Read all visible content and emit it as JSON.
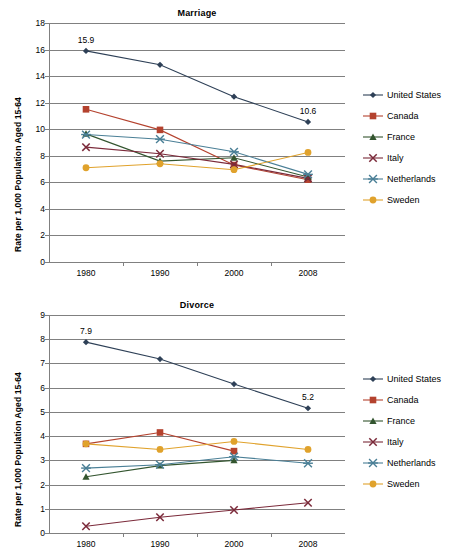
{
  "figure": {
    "width": 466,
    "height": 555
  },
  "series_styles": [
    {
      "name": "United States",
      "color": "#2e4057",
      "marker": "diamond"
    },
    {
      "name": "Canada",
      "color": "#b4422e",
      "marker": "square"
    },
    {
      "name": "France",
      "color": "#33552f",
      "marker": "triangle"
    },
    {
      "name": "Italy",
      "color": "#7b2a3a",
      "marker": "x"
    },
    {
      "name": "Netherlands",
      "color": "#4a7f96",
      "marker": "asterisk"
    },
    {
      "name": "Sweden",
      "color": "#e0a22c",
      "marker": "circle"
    }
  ],
  "legend": {
    "position": "right",
    "items": [
      {
        "label": "United States"
      },
      {
        "label": "Canada"
      },
      {
        "label": "France"
      },
      {
        "label": "Italy"
      },
      {
        "label": "Netherlands"
      },
      {
        "label": "Sweden"
      }
    ]
  },
  "chart_data": [
    {
      "id": "marriage",
      "type": "line",
      "title": "Marriage",
      "xlabel": "",
      "ylabel": "Rate per 1,000 Population Aged 15-64",
      "categories": [
        "1980",
        "1990",
        "2000",
        "2008"
      ],
      "ylim": [
        0,
        18
      ],
      "ytick_step": 2,
      "yticks": [
        0,
        2,
        4,
        6,
        8,
        10,
        12,
        14,
        16,
        18
      ],
      "grid": true,
      "series": [
        {
          "name": "United States",
          "values": [
            15.9,
            14.85,
            12.45,
            10.55
          ]
        },
        {
          "name": "Canada",
          "values": [
            11.5,
            9.95,
            7.3,
            6.2
          ]
        },
        {
          "name": "France",
          "values": [
            9.65,
            7.6,
            7.85,
            6.4
          ]
        },
        {
          "name": "Italy",
          "values": [
            8.65,
            8.15,
            7.35,
            6.3
          ]
        },
        {
          "name": "Netherlands",
          "values": [
            9.6,
            9.25,
            8.3,
            6.6
          ]
        },
        {
          "name": "Sweden",
          "values": [
            7.1,
            7.4,
            6.95,
            8.25
          ]
        }
      ],
      "annotations": [
        {
          "text": "15.9",
          "series": "United States",
          "category": "1980"
        },
        {
          "text": "10.6",
          "series": "United States",
          "category": "2008"
        }
      ]
    },
    {
      "id": "divorce",
      "type": "line",
      "title": "Divorce",
      "xlabel": "",
      "ylabel": "Rate per 1,000 Population Aged 15-64",
      "categories": [
        "1980",
        "1990",
        "2000",
        "2008"
      ],
      "ylim": [
        0,
        9
      ],
      "ytick_step": 1,
      "yticks": [
        0,
        1,
        2,
        3,
        4,
        5,
        6,
        7,
        8,
        9
      ],
      "grid": true,
      "series": [
        {
          "name": "United States",
          "values": [
            7.88,
            7.18,
            6.15,
            5.15
          ]
        },
        {
          "name": "Canada",
          "values": [
            3.68,
            4.15,
            3.38,
            null
          ]
        },
        {
          "name": "France",
          "values": [
            2.32,
            2.78,
            3.0,
            null
          ]
        },
        {
          "name": "Italy",
          "values": [
            0.28,
            0.65,
            0.95,
            1.25
          ]
        },
        {
          "name": "Netherlands",
          "values": [
            2.68,
            2.82,
            3.15,
            2.88
          ]
        },
        {
          "name": "Sweden",
          "values": [
            3.68,
            3.45,
            3.78,
            3.45
          ]
        }
      ],
      "annotations": [
        {
          "text": "7.9",
          "series": "United States",
          "category": "1980"
        },
        {
          "text": "5.2",
          "series": "United States",
          "category": "2008"
        }
      ]
    }
  ]
}
